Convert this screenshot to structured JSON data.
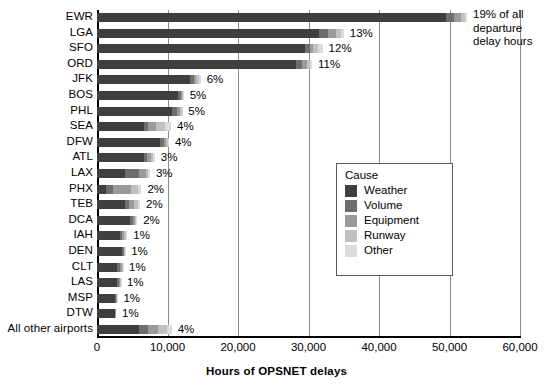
{
  "chart_data": {
    "type": "bar",
    "orientation": "horizontal",
    "stacked": true,
    "title": "",
    "xlabel": "Hours of OPSNET delays",
    "ylabel": "",
    "xlim": [
      0,
      60000
    ],
    "xticks": [
      0,
      10000,
      20000,
      30000,
      40000,
      50000,
      60000
    ],
    "xtick_labels": [
      "0",
      "10,000",
      "20,000",
      "30,000",
      "40,000",
      "50,000",
      "60,000"
    ],
    "grid": true,
    "grid_axis": "x",
    "legend_position": "inside-right",
    "legend_title": "Cause",
    "categories": [
      "EWR",
      "LGA",
      "SFO",
      "ORD",
      "JFK",
      "BOS",
      "PHL",
      "SEA",
      "DFW",
      "ATL",
      "LAX",
      "PHX",
      "TEB",
      "DCA",
      "IAH",
      "DEN",
      "CLT",
      "LAS",
      "MSP",
      "DTW",
      "All other airports"
    ],
    "data_labels": [
      "19%",
      "13%",
      "12%",
      "11%",
      "6%",
      "5%",
      "5%",
      "4%",
      "4%",
      "3%",
      "3%",
      "2%",
      "2%",
      "2%",
      "1%",
      "1%",
      "1%",
      "1%",
      "1%",
      "1%",
      "4%"
    ],
    "totals": [
      52500,
      35000,
      32000,
      30500,
      14700,
      12300,
      12100,
      10500,
      10200,
      8200,
      7500,
      6300,
      6100,
      5700,
      4300,
      4000,
      3700,
      3400,
      2900,
      2700,
      10600
    ],
    "series": [
      {
        "name": "Weather",
        "color": "#3f3f3f",
        "values": [
          49500,
          31500,
          29500,
          28200,
          13200,
          11500,
          10700,
          6600,
          9000,
          6600,
          4000,
          1300,
          4000,
          4700,
          3300,
          3600,
          2800,
          2900,
          2600,
          2500,
          6000
        ]
      },
      {
        "name": "Volume",
        "color": "#6e6e6e",
        "values": [
          1200,
          1300,
          700,
          900,
          500,
          400,
          700,
          600,
          500,
          500,
          2000,
          900,
          600,
          400,
          300,
          200,
          500,
          200,
          100,
          100,
          1200
        ]
      },
      {
        "name": "Equipment",
        "color": "#9a9a9a",
        "values": [
          900,
          1100,
          500,
          700,
          400,
          200,
          400,
          1200,
          300,
          500,
          900,
          2600,
          700,
          300,
          300,
          100,
          200,
          200,
          100,
          100,
          1500
        ]
      },
      {
        "name": "Runway",
        "color": "#c0c0c0",
        "values": [
          600,
          700,
          700,
          400,
          400,
          100,
          200,
          1300,
          300,
          400,
          400,
          1000,
          500,
          200,
          250,
          50,
          150,
          50,
          50,
          0,
          1200
        ]
      },
      {
        "name": "Other",
        "color": "#dcdcdc",
        "values": [
          300,
          400,
          600,
          300,
          200,
          100,
          100,
          800,
          100,
          200,
          200,
          500,
          300,
          100,
          150,
          50,
          50,
          50,
          50,
          0,
          700
        ]
      }
    ],
    "annotation": {
      "text": "19% of all departure delay hours",
      "target_category": "EWR"
    }
  },
  "legend": {
    "title": "Cause",
    "items": [
      {
        "label": "Weather",
        "color": "#3f3f3f"
      },
      {
        "label": "Volume",
        "color": "#6e6e6e"
      },
      {
        "label": "Equipment",
        "color": "#9a9a9a"
      },
      {
        "label": "Runway",
        "color": "#c0c0c0"
      },
      {
        "label": "Other",
        "color": "#dcdcdc"
      }
    ]
  },
  "axis": {
    "x_title": "Hours of OPSNET delays"
  },
  "callout": {
    "line1": "19% of all",
    "line2": "departure",
    "line3": "delay hours"
  }
}
